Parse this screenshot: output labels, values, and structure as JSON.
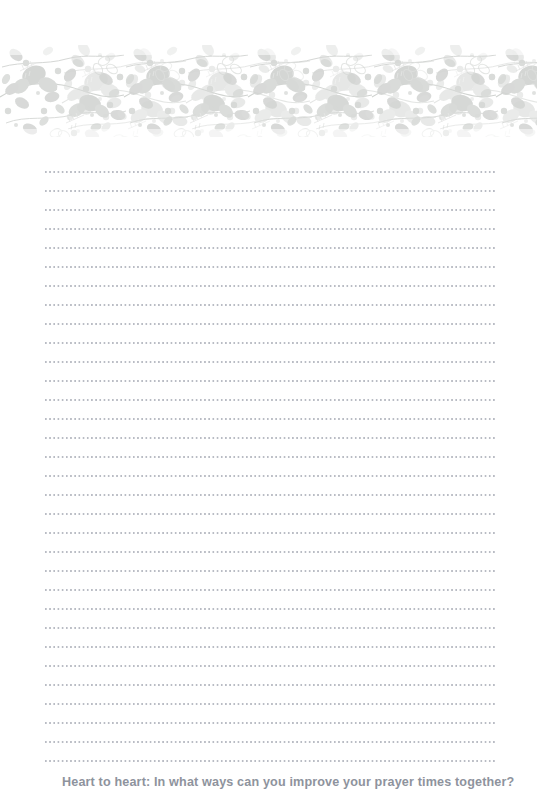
{
  "page": {
    "background_color": "#ffffff",
    "width": 537,
    "height": 802
  },
  "header_ornament": {
    "name": "floral-vine-border",
    "description": "Horizontal botanical band of leafy vines, berries and dots",
    "leaf_color": "#d6d8d6",
    "leaf_color_light": "#e6e8e6",
    "vine_color": "#cfd2cf",
    "dot_color": "#d9dbd9",
    "top": 45,
    "height": 92
  },
  "writing_area": {
    "name": "dotted-rule-lines",
    "line_count": 32,
    "line_spacing_px": 19,
    "dot_color": "#b9bcc4",
    "left_px": 45,
    "right_px": 495,
    "top_px": 168
  },
  "prompt": {
    "label": "Heart to heart:  In what ways can you improve your prayer times together?",
    "color": "#8e939d"
  }
}
